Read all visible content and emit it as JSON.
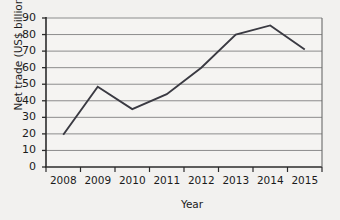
{
  "chart_data": {
    "type": "line",
    "title": "",
    "xlabel": "Year",
    "ylabel": "Net trade (US$ billion)",
    "categories": [
      "2008",
      "2009",
      "2010",
      "2011",
      "2012",
      "2013",
      "2014",
      "2015"
    ],
    "values": [
      19.5,
      48.5,
      35,
      44,
      60,
      80,
      85.5,
      71
    ],
    "x": [
      2008,
      2009,
      2010,
      2011,
      2012,
      2013,
      2014,
      2015
    ],
    "ylim": [
      0,
      90
    ],
    "yticks": [
      0,
      10,
      20,
      30,
      40,
      50,
      60,
      70,
      80,
      90
    ],
    "ytick_labels": [
      "0",
      "10",
      "20",
      "30",
      "40",
      "50",
      "60",
      "70",
      "80",
      "90"
    ],
    "xtick_labels": [
      "2008",
      "2009",
      "2010",
      "2011",
      "2012",
      "2013",
      "2014",
      "2015"
    ],
    "grid": true,
    "grid_axis": "y",
    "legend": false,
    "legend_position": "none",
    "series": [
      {
        "name": "Net trade",
        "values": [
          19.5,
          48.5,
          35,
          44,
          60,
          80,
          85.5,
          71
        ]
      }
    ],
    "colors": {
      "line": "#3a3a42",
      "grid": "#8c8c8c",
      "axis": "#2b2b2b",
      "background": "#f2f1ef",
      "plot_background": "#f5f4f2",
      "text": "#1b1b1b"
    }
  }
}
